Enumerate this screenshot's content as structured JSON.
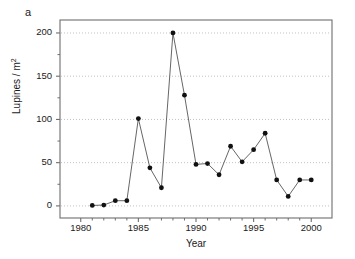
{
  "panel": {
    "label": "a"
  },
  "chart_data": {
    "type": "line",
    "title": "",
    "subtitle": "",
    "xlabel": "Year",
    "ylabel": "Lupines / m2",
    "ylabel_display": "Lupines / m",
    "ylabel_exponent": "2",
    "xlim": [
      1978.2,
      2001.8
    ],
    "ylim": [
      -14,
      215
    ],
    "xticks": [
      1980,
      1985,
      1990,
      1995,
      2000
    ],
    "xtick_labels": [
      "1980",
      "1985",
      "1990",
      "1995",
      "2000"
    ],
    "xminorticks": [
      1981,
      1982,
      1983,
      1984,
      1986,
      1987,
      1988,
      1989,
      1991,
      1992,
      1993,
      1994,
      1996,
      1997,
      1998,
      1999
    ],
    "yticks": [
      0,
      50,
      100,
      150,
      200
    ],
    "ytick_labels": [
      "0",
      "50",
      "100",
      "150",
      "200"
    ],
    "yminorticks": [
      25,
      75,
      125,
      175
    ],
    "grid": "horizontal-dotted-at-major-yticks",
    "legend": "none",
    "marker": "filled-circle",
    "marker_color": "#111111",
    "line_color": "#555555",
    "x": [
      1981,
      1982,
      1983,
      1984,
      1985,
      1986,
      1987,
      1988,
      1989,
      1990,
      1991,
      1992,
      1993,
      1994,
      1995,
      1996,
      1997,
      1998,
      1999,
      2000
    ],
    "values": [
      0.5,
      1,
      6,
      6,
      101,
      44,
      21,
      200,
      128,
      48,
      49,
      36,
      69,
      51,
      65,
      84,
      30,
      11,
      30,
      30
    ],
    "series": [
      {
        "name": "Lupines density",
        "points": [
          {
            "year": 1981,
            "value": 0.5
          },
          {
            "year": 1982,
            "value": 1
          },
          {
            "year": 1983,
            "value": 6
          },
          {
            "year": 1984,
            "value": 6
          },
          {
            "year": 1985,
            "value": 101
          },
          {
            "year": 1986,
            "value": 44
          },
          {
            "year": 1987,
            "value": 21
          },
          {
            "year": 1988,
            "value": 200
          },
          {
            "year": 1989,
            "value": 128
          },
          {
            "year": 1990,
            "value": 48
          },
          {
            "year": 1991,
            "value": 49
          },
          {
            "year": 1992,
            "value": 36
          },
          {
            "year": 1993,
            "value": 69
          },
          {
            "year": 1994,
            "value": 51
          },
          {
            "year": 1995,
            "value": 65
          },
          {
            "year": 1996,
            "value": 84
          },
          {
            "year": 1997,
            "value": 30
          },
          {
            "year": 1998,
            "value": 11
          },
          {
            "year": 1999,
            "value": 30
          },
          {
            "year": 2000,
            "value": 30
          }
        ]
      }
    ]
  },
  "colors": {
    "background": "#ffffff",
    "axis": "#6e6e6e",
    "grid": "#bbbbbb",
    "marker": "#111111",
    "line": "#555555",
    "text": "#1a1a1a"
  }
}
